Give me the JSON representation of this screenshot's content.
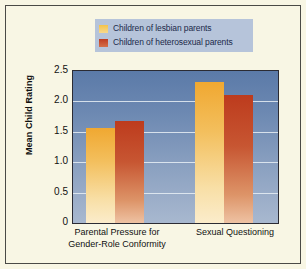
{
  "chart_data": {
    "type": "bar",
    "title": "",
    "subtitle": "",
    "xlabel": "",
    "ylabel": "Mean Child Rating",
    "ylim": [
      0,
      2.5
    ],
    "yticks": [
      "0",
      "0.5",
      "1.0",
      "1.5",
      "2.0",
      "2.5"
    ],
    "ytick_values": [
      0,
      0.5,
      1.0,
      1.5,
      2.0,
      2.5
    ],
    "grid": true,
    "legend_position": "top-center",
    "categories": [
      "Parental Pressure for Gender-Role Conformity",
      "Sexual Questioning"
    ],
    "category_lines": [
      [
        "Parental Pressure for",
        "Gender-Role Conformity"
      ],
      [
        "Sexual Questioning",
        ""
      ]
    ],
    "series": [
      {
        "name": "Children of lesbian parents",
        "color": "#f0a831",
        "values": [
          1.56,
          2.32
        ]
      },
      {
        "name": "Children of heterosexual parents",
        "color": "#bd3b1d",
        "values": [
          1.68,
          2.1
        ]
      }
    ]
  },
  "figure": {
    "background_color": "#f8f6e4",
    "frame_color": "#4a4a46",
    "plot_background": "blue-vertical-gradient",
    "gridline_color": "#e8eef5"
  },
  "legend": {
    "background_color": "#b6c4da",
    "items": [
      {
        "label": "Children of lesbian parents",
        "swatch": "yellow-gradient-swatch"
      },
      {
        "label": "Children of heterosexual parents",
        "swatch": "red-gradient-swatch"
      }
    ]
  },
  "axes": {
    "y_title": "Mean Child Rating",
    "y_tick_labels": [
      "2.5",
      "2.0",
      "1.5",
      "1.0",
      "0.5",
      "0"
    ],
    "x_tick_labels": [
      {
        "line1": "Parental Pressure for",
        "line2": "Gender-Role Conformity"
      },
      {
        "line1": "Sexual Questioning",
        "line2": ""
      }
    ]
  }
}
